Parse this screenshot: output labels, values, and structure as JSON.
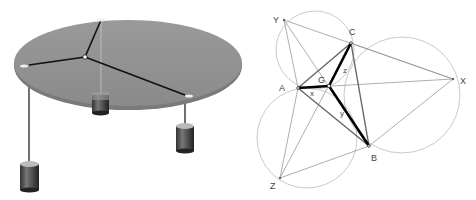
{
  "left_figure": {
    "description": "Varignon frame: table with three weights on strings joined at a knot"
  },
  "right_figure": {
    "labels": {
      "Y": "Y",
      "C": "C",
      "X": "X",
      "A": "A",
      "G": "G",
      "B": "B",
      "Z": "Z",
      "x": "x",
      "y": "y",
      "z": "z"
    }
  }
}
